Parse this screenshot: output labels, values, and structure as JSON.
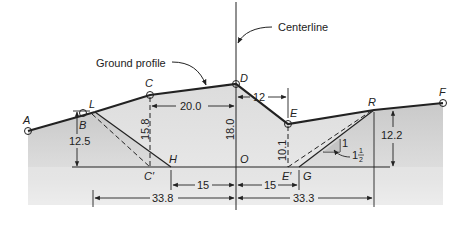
{
  "diagram": {
    "callouts": {
      "centerline": "Centerline",
      "ground_profile": "Ground profile"
    },
    "points": {
      "A": "A",
      "B": "B",
      "L": "L",
      "C": "C",
      "D": "D",
      "E": "E",
      "R": "R",
      "F": "F",
      "H": "H",
      "C_prime": "C′",
      "O": "O",
      "E_prime": "E′",
      "G": "G"
    },
    "dimensions": {
      "C_to_D_horizontal": "20.0",
      "D_to_E_horizontal": "12",
      "C_height": "15.8",
      "D_height": "18.0",
      "E_height": "10.1",
      "L_height": "12.5",
      "R_height": "12.2",
      "H_to_O": "15",
      "O_to_G": "15",
      "L_offset_left": "33.8",
      "R_offset_right": "33.3"
    },
    "slope": {
      "rise": "1",
      "run_whole": "1",
      "run_num": "1",
      "run_den": "2"
    },
    "colors": {
      "line": "#222222",
      "shade_light": "#e6e6e6",
      "shade_dark": "#c8c8c8"
    }
  }
}
